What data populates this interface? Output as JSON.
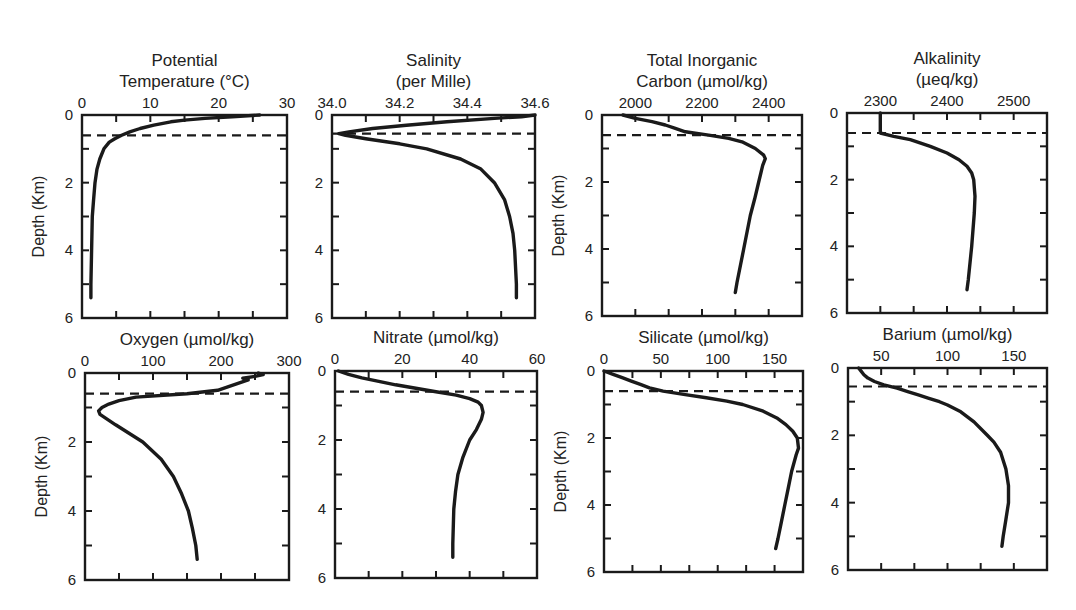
{
  "figure": {
    "depth_axis_label": "Depth (Km)",
    "line_color": "#1a1a1a",
    "background": "#ffffff"
  },
  "chart_data": [
    {
      "type": "line",
      "id": "temperature",
      "title_lines": [
        "Potential",
        "Temperature (°C)"
      ],
      "xlabel": "Potential Temperature (°C)",
      "ylabel": "Depth (Km)",
      "show_ylabel": true,
      "xlim": [
        0,
        30
      ],
      "xticks": [
        0,
        10,
        20,
        30
      ],
      "xtick_labels": [
        "0",
        "10",
        "20",
        "30"
      ],
      "minor_xticks": [
        5,
        15,
        25
      ],
      "ylim": [
        0,
        6
      ],
      "yticks": [
        0,
        2,
        4,
        6
      ],
      "y_inverted": true,
      "grid": false,
      "mixed_layer_depth": 0.6,
      "box": [
        82,
        115,
        287,
        318
      ],
      "depth": [
        0.0,
        0.05,
        0.1,
        0.15,
        0.2,
        0.3,
        0.4,
        0.5,
        0.6,
        0.7,
        0.8,
        1.0,
        1.3,
        1.6,
        2.0,
        2.5,
        3.0,
        4.0,
        5.0,
        5.4
      ],
      "values": [
        26,
        22,
        18,
        15,
        13,
        10.5,
        8.5,
        7,
        5.8,
        4.8,
        4.0,
        3.2,
        2.6,
        2.2,
        1.9,
        1.7,
        1.5,
        1.4,
        1.3,
        1.3
      ]
    },
    {
      "type": "line",
      "id": "salinity",
      "title_lines": [
        "Salinity",
        "(per Mille)"
      ],
      "xlabel": "Salinity (per Mille)",
      "ylabel": "Depth (Km)",
      "show_ylabel": false,
      "xlim": [
        34.0,
        34.6
      ],
      "xticks": [
        34.0,
        34.2,
        34.4,
        34.6
      ],
      "xtick_labels": [
        "34.0",
        "34.2",
        "34.4",
        "34.6"
      ],
      "minor_xticks": [
        34.1,
        34.3,
        34.5
      ],
      "ylim": [
        0,
        6
      ],
      "yticks": [
        0,
        2,
        4,
        6
      ],
      "y_inverted": true,
      "grid": false,
      "mixed_layer_depth": 0.55,
      "box": [
        332,
        115,
        535,
        318
      ],
      "depth": [
        0.0,
        0.05,
        0.1,
        0.2,
        0.3,
        0.4,
        0.5,
        0.55,
        0.6,
        0.7,
        0.85,
        1.0,
        1.3,
        1.6,
        2.0,
        2.5,
        3.0,
        3.5,
        4.0,
        5.0,
        5.4
      ],
      "values": [
        34.6,
        34.56,
        34.48,
        34.34,
        34.22,
        34.12,
        34.05,
        34.02,
        34.04,
        34.1,
        34.2,
        34.28,
        34.38,
        34.44,
        34.48,
        34.51,
        34.525,
        34.535,
        34.54,
        34.545,
        34.545
      ]
    },
    {
      "type": "line",
      "id": "tic",
      "title_lines": [
        "Total Inorganic",
        "Carbon (µmol/kg)"
      ],
      "xlabel": "Total Inorganic Carbon (µmol/kg)",
      "ylabel": "Depth (Km)",
      "show_ylabel": true,
      "xlim": [
        1900,
        2500
      ],
      "xticks": [
        2000,
        2200,
        2400
      ],
      "xtick_labels": [
        "2000",
        "2200",
        "2400"
      ],
      "minor_xticks": [
        2100,
        2300
      ],
      "ylim": [
        0,
        6
      ],
      "yticks": [
        0,
        2,
        4,
        6
      ],
      "y_inverted": true,
      "grid": false,
      "mixed_layer_depth": 0.6,
      "box": [
        602,
        115,
        802,
        316
      ],
      "depth": [
        0.0,
        0.1,
        0.2,
        0.3,
        0.4,
        0.5,
        0.6,
        0.7,
        0.8,
        1.0,
        1.2,
        1.3,
        1.5,
        2.0,
        2.5,
        3.0,
        4.0,
        5.0,
        5.3
      ],
      "values": [
        1963,
        2000,
        2050,
        2090,
        2120,
        2150,
        2220,
        2280,
        2320,
        2360,
        2385,
        2390,
        2382,
        2370,
        2358,
        2345,
        2325,
        2305,
        2300
      ]
    },
    {
      "type": "line",
      "id": "alkalinity",
      "title_lines": [
        "Alkalinity",
        "(µeq/kg)"
      ],
      "xlabel": "Alkalinity (µeq/kg)",
      "ylabel": "Depth (Km)",
      "show_ylabel": false,
      "xlim": [
        2250,
        2550
      ],
      "xticks": [
        2300,
        2400,
        2500
      ],
      "xtick_labels": [
        "2300",
        "2400",
        "2500"
      ],
      "minor_xticks": [
        2350,
        2450
      ],
      "ylim": [
        0,
        6
      ],
      "yticks": [
        0,
        2,
        4,
        6
      ],
      "y_inverted": true,
      "grid": false,
      "mixed_layer_depth": 0.6,
      "box": [
        847,
        113,
        1047,
        313
      ],
      "depth": [
        0.0,
        0.6,
        0.7,
        0.8,
        1.0,
        1.2,
        1.4,
        1.6,
        1.8,
        2.0,
        2.5,
        3.0,
        4.0,
        5.0,
        5.3
      ],
      "values": [
        2300,
        2300,
        2320,
        2345,
        2375,
        2400,
        2418,
        2430,
        2437,
        2440,
        2442,
        2441,
        2437,
        2432,
        2430
      ]
    },
    {
      "type": "line",
      "id": "oxygen",
      "title_lines": [
        "Oxygen (µmol/kg)"
      ],
      "xlabel": "Oxygen (µmol/kg)",
      "ylabel": "Depth (Km)",
      "show_ylabel": true,
      "xlim": [
        0,
        300
      ],
      "xticks": [
        0,
        100,
        200,
        300
      ],
      "xtick_labels": [
        "0",
        "100",
        "200",
        "300"
      ],
      "minor_xticks": [
        50,
        150,
        250
      ],
      "ylim": [
        0,
        6
      ],
      "yticks": [
        0,
        2,
        4,
        6
      ],
      "y_inverted": true,
      "grid": false,
      "mixed_layer_depth": 0.6,
      "box": [
        85,
        373,
        289,
        580
      ],
      "depth": [
        0.0,
        0.05,
        0.1,
        0.15,
        0.2,
        0.3,
        0.4,
        0.5,
        0.6,
        0.7,
        0.8,
        0.9,
        1.0,
        1.1,
        1.2,
        1.5,
        2.0,
        2.5,
        3.0,
        3.5,
        4.0,
        4.5,
        5.0,
        5.4
      ],
      "values": [
        255,
        262,
        250,
        232,
        240,
        225,
        210,
        195,
        150,
        75,
        50,
        35,
        25,
        20,
        22,
        45,
        85,
        112,
        130,
        142,
        152,
        158,
        163,
        165
      ]
    },
    {
      "type": "line",
      "id": "nitrate",
      "title_lines": [
        "Nitrate (µmol/kg)"
      ],
      "xlabel": "Nitrate (µmol/kg)",
      "ylabel": "Depth (Km)",
      "show_ylabel": false,
      "xlim": [
        0,
        60
      ],
      "xticks": [
        0,
        20,
        40,
        60
      ],
      "xtick_labels": [
        "0",
        "20",
        "40",
        "60"
      ],
      "minor_xticks": [
        10,
        30,
        50
      ],
      "ylim": [
        0,
        6
      ],
      "yticks": [
        0,
        2,
        4,
        6
      ],
      "y_inverted": true,
      "grid": false,
      "mixed_layer_depth": 0.6,
      "box": [
        335,
        371,
        537,
        578
      ],
      "depth": [
        0.0,
        0.1,
        0.2,
        0.3,
        0.4,
        0.5,
        0.6,
        0.7,
        0.8,
        0.9,
        1.0,
        1.2,
        1.4,
        1.7,
        2.0,
        2.5,
        3.0,
        3.5,
        4.0,
        5.0,
        5.4
      ],
      "values": [
        1,
        4,
        8,
        13,
        18,
        24,
        30,
        36,
        40,
        42.5,
        43.5,
        44,
        43.5,
        42,
        40,
        38,
        36.5,
        35.8,
        35.3,
        35,
        35
      ]
    },
    {
      "type": "line",
      "id": "silicate",
      "title_lines": [
        "Silicate (µmol/kg)"
      ],
      "xlabel": "Silicate (µmol/kg)",
      "ylabel": "Depth (Km)",
      "show_ylabel": true,
      "xlim": [
        0,
        175
      ],
      "xticks": [
        0,
        50,
        100,
        150
      ],
      "xtick_labels": [
        "0",
        "50",
        "100",
        "150"
      ],
      "minor_xticks": [
        25,
        75,
        125,
        175
      ],
      "ylim": [
        0,
        6
      ],
      "yticks": [
        0,
        2,
        4,
        6
      ],
      "y_inverted": true,
      "grid": false,
      "mixed_layer_depth": 0.6,
      "box": [
        604,
        371,
        803,
        572
      ],
      "depth": [
        0.0,
        0.1,
        0.2,
        0.3,
        0.4,
        0.5,
        0.6,
        0.7,
        0.8,
        0.9,
        1.0,
        1.2,
        1.4,
        1.6,
        1.8,
        2.0,
        2.3,
        2.5,
        3.0,
        3.5,
        4.0,
        4.5,
        5.0,
        5.3
      ],
      "values": [
        0,
        8,
        16,
        24,
        32,
        40,
        52,
        70,
        90,
        108,
        122,
        140,
        152,
        160,
        166,
        170,
        171,
        169,
        165,
        162,
        159,
        156,
        153,
        151
      ]
    },
    {
      "type": "line",
      "id": "barium",
      "title_lines": [
        "Barium (µmol/kg)"
      ],
      "xlabel": "Barium (µmol/kg)",
      "ylabel": "Depth (Km)",
      "show_ylabel": false,
      "xlim": [
        25,
        175
      ],
      "xticks": [
        50,
        100,
        150
      ],
      "xtick_labels": [
        "50",
        "100",
        "150"
      ],
      "minor_xticks": [
        75,
        125
      ],
      "ylim": [
        0,
        6
      ],
      "yticks": [
        0,
        2,
        4,
        6
      ],
      "y_inverted": true,
      "grid": false,
      "mixed_layer_depth": 0.55,
      "box": [
        848,
        368,
        1047,
        570
      ],
      "depth": [
        0.0,
        0.1,
        0.2,
        0.3,
        0.4,
        0.5,
        0.6,
        0.7,
        0.8,
        0.9,
        1.0,
        1.1,
        1.3,
        1.6,
        2.0,
        2.2,
        2.5,
        3.0,
        3.5,
        4.0,
        4.5,
        5.0,
        5.3
      ],
      "values": [
        33,
        35,
        37,
        40,
        45,
        52,
        62,
        70,
        78,
        86,
        94,
        100,
        110,
        120,
        130,
        135,
        140,
        144,
        146,
        146,
        144,
        142,
        141
      ]
    }
  ]
}
